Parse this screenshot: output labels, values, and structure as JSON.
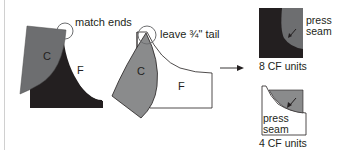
{
  "diagram": {
    "steps": [
      {
        "id": "step1",
        "annotation": "match ends",
        "pieces": {
          "curve": "C",
          "frame": "F"
        },
        "colors": {
          "curve": "#6d6e70",
          "frame": "#231f20"
        }
      },
      {
        "id": "step2",
        "annotation": "leave ¾\" tail",
        "pieces": {
          "curve": "C",
          "frame": "F"
        },
        "colors": {
          "curve": "#8a8b8c",
          "frame": "#ffffff"
        }
      }
    ],
    "results": [
      {
        "id": "result-dark",
        "press_label": "press\nseam",
        "caption": "8 CF units",
        "colors": {
          "curve": "#6d6e70",
          "frame": "#231f20"
        }
      },
      {
        "id": "result-light",
        "press_label": "press\nseam",
        "caption": "4 CF units",
        "colors": {
          "curve": "#8a8b8c",
          "frame": "#ffffff"
        }
      }
    ],
    "arrow": "right-arrow",
    "outline_color": "#231f20",
    "annotation_circle_color": "#6d6e70"
  }
}
